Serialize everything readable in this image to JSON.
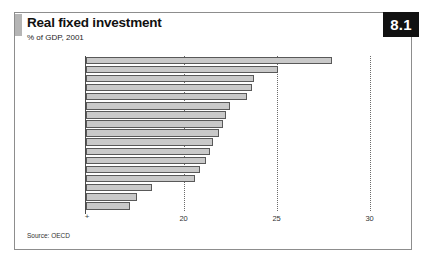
{
  "figure": {
    "badge": "8.1",
    "title": "Real fixed investment",
    "subtitle": "% of GDP, 2001",
    "source": "Source: OECD"
  },
  "axis": {
    "origin_mark": "+",
    "tick_labels": [
      "20",
      "25",
      "30"
    ]
  },
  "chart_data": {
    "type": "bar",
    "orientation": "horizontal",
    "title": "Real fixed investment",
    "subtitle": "% of GDP, 2001",
    "xlabel": "",
    "ylabel": "",
    "units": "% of GDP",
    "year": 2001,
    "source": "OECD",
    "xlim": [
      14.7,
      30.6
    ],
    "xticks": [
      20,
      25,
      30
    ],
    "grid": "vertical dotted gridlines at 20, 25 and 30",
    "legend": "none",
    "categories": [
      "Japan",
      "Spain",
      "Denmark",
      "Austria",
      "OECD",
      "Netherlands",
      "USA",
      "Switzerland",
      "Australia",
      "Germany",
      "EU",
      "France",
      "Belgium",
      "Canada",
      "UK",
      "Italy",
      "Sweden"
    ],
    "values": [
      28.0,
      25.1,
      23.8,
      23.7,
      23.4,
      22.5,
      22.3,
      22.1,
      21.9,
      21.6,
      21.4,
      21.2,
      20.9,
      20.6,
      18.3,
      17.5,
      17.1
    ],
    "series": [
      {
        "name": "Real fixed investment (% of GDP, 2001)",
        "values": [
          28.0,
          25.1,
          23.8,
          23.7,
          23.4,
          22.5,
          22.3,
          22.1,
          21.9,
          21.6,
          21.4,
          21.2,
          20.9,
          20.6,
          18.3,
          17.5,
          17.1
        ]
      }
    ],
    "colors": {
      "bar_fill": "#c9c9c9",
      "bar_stroke": "#595959",
      "badge_background": "#111111",
      "badge_text": "#ffffff",
      "frame": "#8d8d8d"
    }
  }
}
